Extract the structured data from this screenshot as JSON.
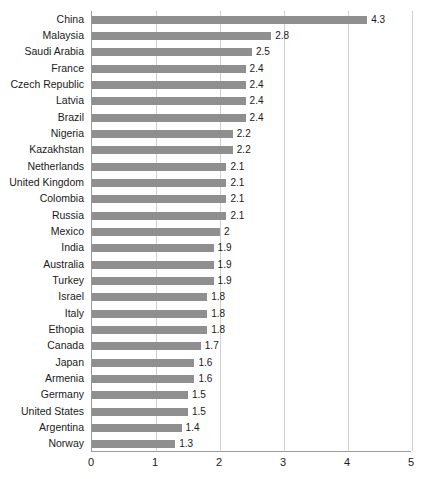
{
  "chart_data": {
    "type": "bar",
    "orientation": "horizontal",
    "title": "",
    "subtitle": "",
    "xlabel": "",
    "ylabel": "",
    "xlim": [
      0,
      5
    ],
    "xticks": [
      "0",
      "1",
      "2",
      "3",
      "4",
      "5"
    ],
    "xtick_values": [
      0,
      1,
      2,
      3,
      4,
      5
    ],
    "grid": true,
    "grid_axis": "x",
    "legend": false,
    "legend_position": "none",
    "bar_color": "#8f8f8f",
    "gridline_color": "#cfcfcf",
    "axis_color": "#9a9a9a",
    "text_color": "#1a1a1a",
    "categories": [
      "China",
      "Malaysia",
      "Saudi Arabia",
      "France",
      "Czech Republic",
      "Latvia",
      "Brazil",
      "Nigeria",
      "Kazakhstan",
      "Netherlands",
      "United Kingdom",
      "Colombia",
      "Russia",
      "Mexico",
      "India",
      "Australia",
      "Turkey",
      "Israel",
      "Italy",
      "Ethopia",
      "Canada",
      "Japan",
      "Armenia",
      "Germany",
      "United States",
      "Argentina",
      "Norway"
    ],
    "values": [
      4.3,
      2.8,
      2.5,
      2.4,
      2.4,
      2.4,
      2.4,
      2.2,
      2.2,
      2.1,
      2.1,
      2.1,
      2.1,
      2,
      1.9,
      1.9,
      1.9,
      1.8,
      1.8,
      1.8,
      1.7,
      1.6,
      1.6,
      1.5,
      1.5,
      1.4,
      1.3
    ],
    "value_labels": [
      "4.3",
      "2.8",
      "2.5",
      "2.4",
      "2.4",
      "2.4",
      "2.4",
      "2.2",
      "2.2",
      "2.1",
      "2.1",
      "2.1",
      "2.1",
      "2",
      "1.9",
      "1.9",
      "1.9",
      "1.8",
      "1.8",
      "1.8",
      "1.7",
      "1.6",
      "1.6",
      "1.5",
      "1.5",
      "1.4",
      "1.3"
    ]
  }
}
